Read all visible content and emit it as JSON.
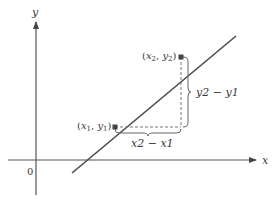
{
  "diagram": {
    "axes": {
      "x_label": "x",
      "y_label": "y",
      "origin_label": "0"
    },
    "points": [
      {
        "id": "p1",
        "label": "(x1, y1)",
        "label_parts": [
          "(",
          "x",
          "1",
          ", ",
          "y",
          "1",
          ")"
        ]
      },
      {
        "id": "p2",
        "label": "(x2, y2)",
        "label_parts": [
          "(",
          "x",
          "2",
          ", ",
          "y",
          "2",
          ")"
        ]
      }
    ],
    "run_label": "x2 − x1",
    "rise_label": "y2 − y1",
    "colors": {
      "line": "#4a4a4a",
      "axes": "#555555",
      "dashed": "#777777",
      "point": "#444444",
      "text": "#3a3a3a"
    }
  }
}
